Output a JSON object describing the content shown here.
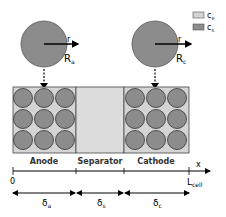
{
  "legend": [
    {
      "symbol": "c",
      "sub": "e",
      "color": "#d4d4d4"
    },
    {
      "symbol": "c",
      "sub": "s",
      "color": "#8c8c8c"
    }
  ],
  "particles": {
    "anode": {
      "label": "R",
      "sub": "a",
      "radial": "r"
    },
    "cathode": {
      "label": "R",
      "sub": "c",
      "radial": "r"
    }
  },
  "regions": {
    "anode": "Anode",
    "separator": "Separator",
    "cathode": "Cathode"
  },
  "axis": {
    "label": "x",
    "start": "0",
    "end": "L",
    "end_sub": "cell"
  },
  "thicknesses": [
    {
      "symbol": "δ",
      "sub": "a"
    },
    {
      "symbol": "δ",
      "sub": "s"
    },
    {
      "symbol": "δ",
      "sub": "c"
    }
  ],
  "colors": {
    "electrolyte": "#d4d4d4",
    "solid": "#8c8c8c",
    "separator": "#dcdcdc",
    "stroke": "#333333"
  }
}
